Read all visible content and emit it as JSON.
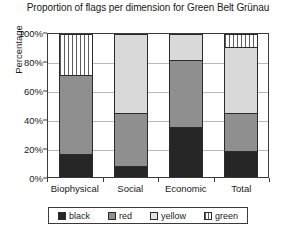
{
  "chart_data": {
    "type": "bar",
    "subtype": "stacked-bar-100",
    "title": "Proportion of flags per dimension for Green Belt Grünau",
    "xlabel": "",
    "ylabel": "Percentage",
    "ylim": [
      0,
      100
    ],
    "yticks": [
      0,
      20,
      40,
      60,
      80,
      100
    ],
    "ytick_labels": [
      "0%",
      "20%",
      "40%",
      "60%",
      "80%",
      "100%"
    ],
    "grid": true,
    "legend_position": "bottom",
    "categories": [
      "Biophysical",
      "Social",
      "Economic",
      "Total"
    ],
    "series": [
      {
        "name": "black",
        "color": "#262626",
        "values": [
          16,
          8,
          35,
          18
        ]
      },
      {
        "name": "red",
        "color": "#8f8f8f",
        "values": [
          55,
          37,
          47,
          27
        ]
      },
      {
        "name": "yellow",
        "color": "#d9d9d9",
        "values": [
          0,
          55,
          18,
          46
        ]
      },
      {
        "name": "green",
        "color": "#ffffff",
        "pattern": "vertical-hatch",
        "values": [
          29,
          0,
          0,
          9
        ]
      }
    ]
  },
  "legend": {
    "items": [
      {
        "label": "black"
      },
      {
        "label": "red"
      },
      {
        "label": "yellow"
      },
      {
        "label": "green"
      }
    ]
  }
}
